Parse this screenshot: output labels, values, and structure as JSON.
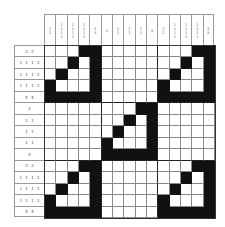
{
  "puzzle": {
    "type": "nonogram",
    "size": [
      15,
      15
    ],
    "column_clues": [
      [
        "2",
        "2"
      ],
      [
        "1",
        "1",
        "1",
        "1"
      ],
      [
        "1",
        "1",
        "1",
        "1"
      ],
      [
        "1",
        "1",
        "1",
        "1"
      ],
      [
        "5",
        "5"
      ],
      [
        "2"
      ],
      [
        "1",
        "1"
      ],
      [
        "1",
        "1"
      ],
      [
        "1",
        "1"
      ],
      [
        "5"
      ],
      [
        "2",
        "2"
      ],
      [
        "1",
        "1",
        "1",
        "1"
      ],
      [
        "1",
        "1",
        "1",
        "1"
      ],
      [
        "1",
        "1",
        "1",
        "1"
      ],
      [
        "5",
        "5"
      ]
    ],
    "row_clues": [
      "2 2",
      "1 1 1 1",
      "1 1 1 1",
      "1 1 1 1",
      "5 5",
      "2",
      "1 1",
      "1 1",
      "1 1",
      "5",
      "2 2",
      "1 1 1 1",
      "1 1 1 1",
      "1 1 1 1",
      "5 5"
    ],
    "solution": [
      "000110000000011",
      "001010000000101",
      "010010000001001",
      "100010000010001",
      "111110000011111",
      "000000001100000",
      "000000010100000",
      "000000100100000",
      "000001000100000",
      "000001111100000",
      "000110000000011",
      "001010000000101",
      "010010000001001",
      "100010000010001",
      "111110000011111"
    ],
    "colors": {
      "filled": "#111111",
      "empty": "#ffffff",
      "grid_line": "#888888"
    }
  }
}
